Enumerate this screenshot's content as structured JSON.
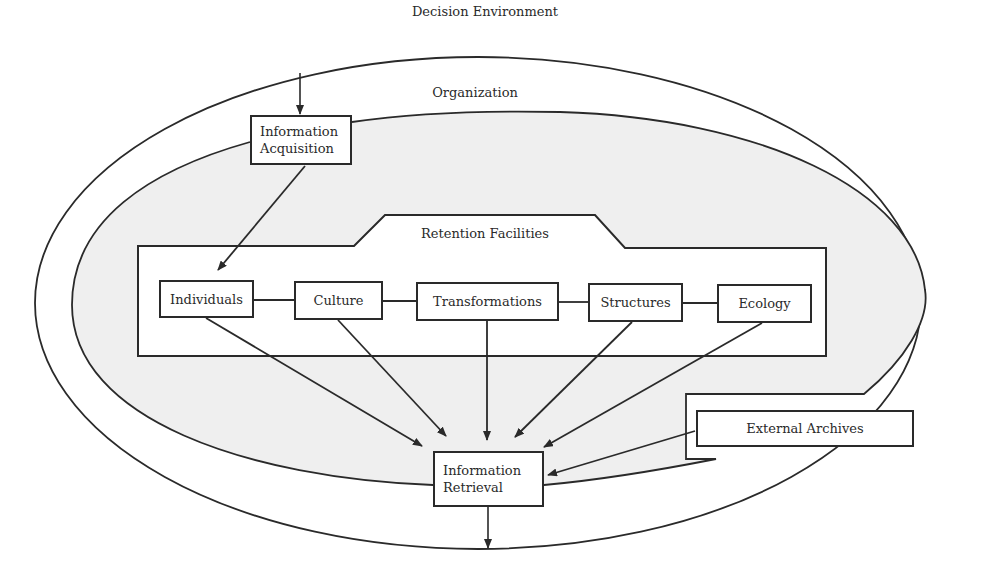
{
  "diagram": {
    "colors": {
      "line": "#2a2a2a",
      "organization_fill": "#efefef",
      "background": "#ffffff",
      "box_fill": "#ffffff"
    },
    "regions": {
      "decision_environment": "Decision Environment",
      "organization": "Organization",
      "retention_facilities": "Retention Facilities"
    },
    "nodes": {
      "information_acquisition": {
        "line1": "Information",
        "line2": "Acquisition"
      },
      "individuals": "Individuals",
      "culture": "Culture",
      "transformations": "Transformations",
      "structures": "Structures",
      "ecology": "Ecology",
      "information_retrieval": {
        "line1": "Information",
        "line2": "Retrieval"
      },
      "external_archives": "External Archives"
    },
    "edges": [
      {
        "from": "Decision Environment",
        "to": "Information Acquisition",
        "type": "arrow"
      },
      {
        "from": "Information Acquisition",
        "to": "Individuals",
        "type": "arrow"
      },
      {
        "from": "Individuals",
        "to": "Culture",
        "type": "line"
      },
      {
        "from": "Culture",
        "to": "Transformations",
        "type": "line"
      },
      {
        "from": "Transformations",
        "to": "Structures",
        "type": "line"
      },
      {
        "from": "Structures",
        "to": "Ecology",
        "type": "line"
      },
      {
        "from": "Individuals",
        "to": "Information Retrieval",
        "type": "arrow"
      },
      {
        "from": "Culture",
        "to": "Information Retrieval",
        "type": "arrow"
      },
      {
        "from": "Transformations",
        "to": "Information Retrieval",
        "type": "arrow"
      },
      {
        "from": "Structures",
        "to": "Information Retrieval",
        "type": "arrow"
      },
      {
        "from": "Ecology",
        "to": "Information Retrieval",
        "type": "arrow"
      },
      {
        "from": "External Archives",
        "to": "Information Retrieval",
        "type": "arrow"
      },
      {
        "from": "Information Retrieval",
        "to": "Decision Environment",
        "type": "arrow"
      }
    ]
  }
}
